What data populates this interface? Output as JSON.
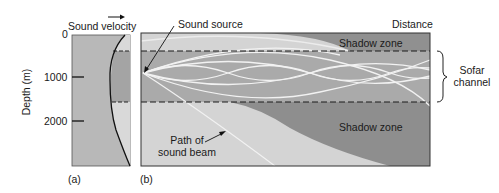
{
  "panel_a": {
    "title": "Sound velocity",
    "arrow": "right-arrow",
    "y_axis_label": "Depth (m)",
    "y_ticks": [
      "0",
      "1000",
      "2000"
    ],
    "caption": "(a)"
  },
  "panel_b": {
    "sound_source_label": "Sound source",
    "distance_label": "Distance",
    "shadow_zone_top": "Shadow zone",
    "shadow_zone_bottom": "Shadow zone",
    "sofar_label_line1": "Sofar",
    "sofar_label_line2": "channel",
    "beam_label_line1": "Path of",
    "beam_label_line2": "sound beam",
    "caption": "(b)"
  },
  "colors": {
    "light_gray": "#d6d6d6",
    "mid_gray": "#b4b4b4",
    "dark_gray": "#8f8f8f",
    "channel_gray": "#a9a9a9",
    "ray_white": "#f4f4f4",
    "outline": "#2a2a2a"
  }
}
